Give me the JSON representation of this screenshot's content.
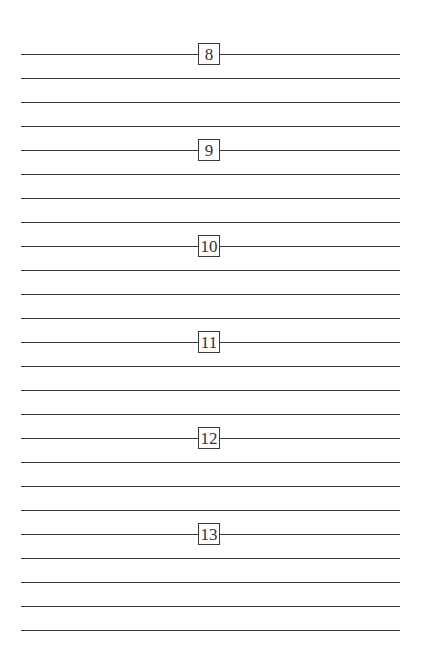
{
  "sections": [
    {
      "number": "8",
      "y": 54
    },
    {
      "number": "9",
      "y": 150
    },
    {
      "number": "10",
      "y": 246
    },
    {
      "number": "11",
      "y": 342
    },
    {
      "number": "12",
      "y": 438
    },
    {
      "number": "13",
      "y": 534
    }
  ],
  "lines_per_section": 4,
  "trailing_line_y": 630,
  "line_spacing": 24,
  "colors": {
    "line": "#3a3a3a",
    "background": "#ffffff"
  }
}
